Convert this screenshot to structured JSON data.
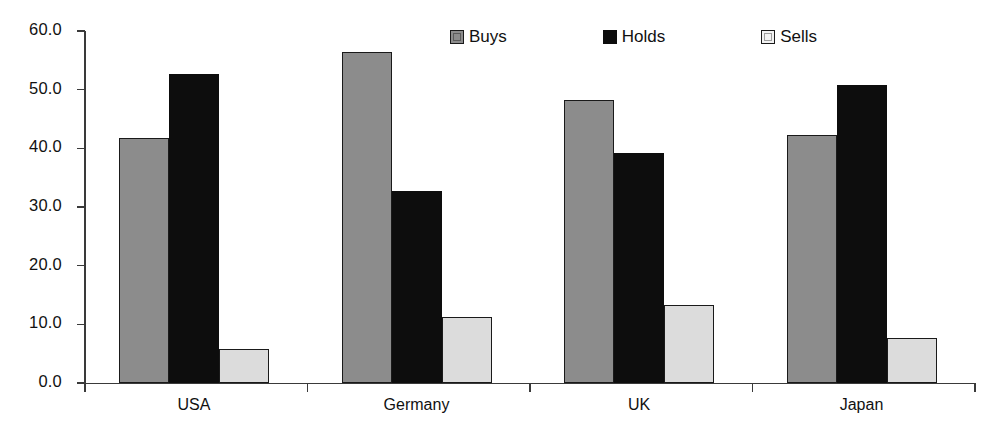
{
  "chart_data": {
    "type": "bar",
    "title": "",
    "subtitle": "",
    "xlabel": "",
    "ylabel": "",
    "categories": [
      "USA",
      "Germany",
      "UK",
      "Japan"
    ],
    "series": [
      {
        "name": "Buys",
        "color": "#8c8c8c",
        "values": [
          41.8,
          56.5,
          48.2,
          42.3
        ]
      },
      {
        "name": "Holds",
        "color": "#0d0d0d",
        "values": [
          52.6,
          32.7,
          39.2,
          50.8
        ]
      },
      {
        "name": "Sells",
        "color": "#dcdcdc",
        "values": [
          5.8,
          11.3,
          13.3,
          7.7
        ]
      }
    ],
    "ylim": [
      0.0,
      60.0
    ],
    "ytick_values": [
      60.0,
      50.0,
      40.0,
      30.0,
      20.0,
      10.0,
      0.0
    ],
    "ytick_labels": [
      "60.0",
      "50.0",
      "40.0",
      "30.0",
      "20.0",
      "10.0",
      "0.0"
    ],
    "grid": false,
    "legend_position": "top-right",
    "legend_entries": [
      "Buys",
      "Holds",
      "Sells"
    ],
    "annotations": []
  },
  "axis": {
    "line_color": "#3a3a3a"
  }
}
